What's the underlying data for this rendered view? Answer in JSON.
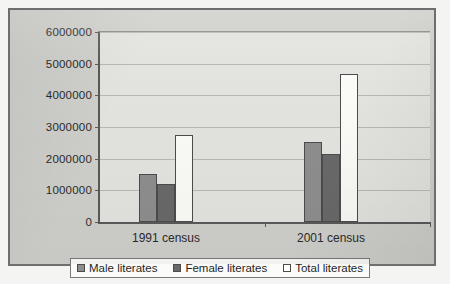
{
  "chart_data": {
    "type": "bar",
    "title": "",
    "subtitle": "",
    "xlabel": "",
    "ylabel": "",
    "categories": [
      "1991 census",
      "2001 census"
    ],
    "series": [
      {
        "name": "Male literates",
        "key": "male",
        "color": "#8e8e8e",
        "values": [
          1520000,
          2530000
        ]
      },
      {
        "name": "Female literates",
        "key": "female",
        "color": "#696969",
        "values": [
          1200000,
          2150000
        ]
      },
      {
        "name": "Total literates",
        "key": "total",
        "color": "#ffffff",
        "values": [
          2750000,
          4680000
        ]
      }
    ],
    "ylim": [
      0,
      6000000
    ],
    "ytick_labels": [
      "0",
      "1000000",
      "2000000",
      "3000000",
      "4000000",
      "5000000",
      "6000000"
    ],
    "ytick_values": [
      0,
      1000000,
      2000000,
      3000000,
      4000000,
      5000000,
      6000000
    ],
    "grid": true,
    "legend_position": "bottom",
    "plot_background": "#e3e3df",
    "figure_background": "#cfcfcb",
    "axis_color": "#59595a"
  }
}
